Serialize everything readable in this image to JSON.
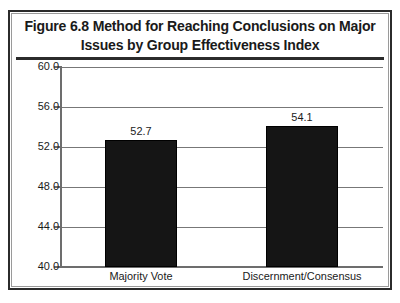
{
  "figure": {
    "title_lines": [
      "Figure 6.8 Method for Reaching Conclusions on Major",
      "Issues by Group Effectiveness Index"
    ],
    "title_full": "Figure 6.8 Method for Reaching Conclusions on Major Issues by Group Effectiveness Index",
    "colors": {
      "bar": "#151515",
      "frame": "#2b2b2b",
      "gridline": "#777777",
      "axis": "#6d6d6d",
      "text": "#1a1a1a",
      "background": "#ffffff"
    }
  },
  "chart_data": {
    "type": "bar",
    "title": "Figure 6.8 Method for Reaching Conclusions on Major Issues by Group Effectiveness Index",
    "categories": [
      "Majority Vote",
      "Discernment/Consensus"
    ],
    "values": [
      52.7,
      54.1
    ],
    "value_labels": [
      "52.7",
      "54.1"
    ],
    "xlabel": "",
    "ylabel": "",
    "ylim": [
      40.0,
      60.0
    ],
    "ytick_step": 4.0,
    "ytick_labels": [
      "60.0",
      "56.0",
      "52.0",
      "48.0",
      "44.0",
      "40.0"
    ],
    "ytick_values": [
      60.0,
      56.0,
      52.0,
      48.0,
      44.0,
      40.0
    ],
    "grid": true,
    "legend": false,
    "legend_position": "none",
    "orientation": "vertical"
  }
}
